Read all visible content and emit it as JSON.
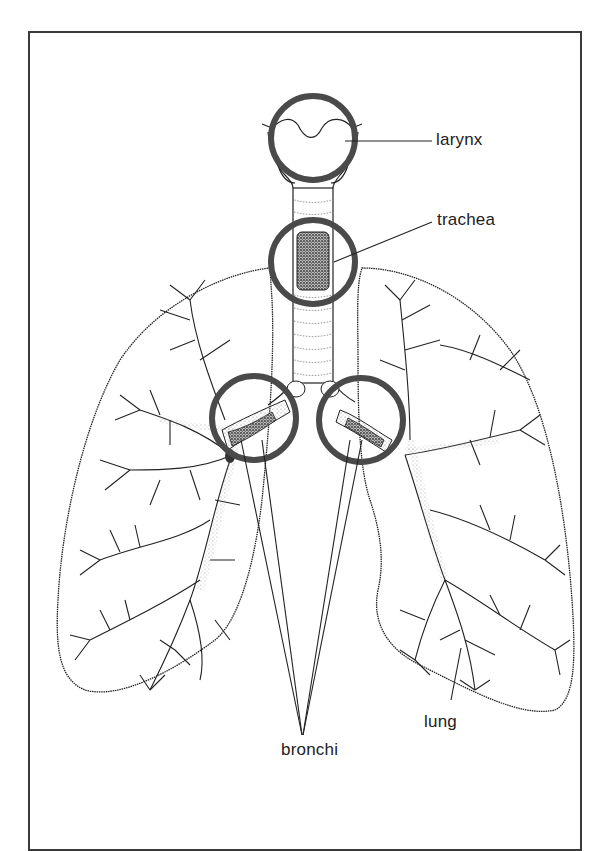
{
  "figure": {
    "labels": {
      "larynx": "larynx",
      "trachea": "trachea",
      "bronchi": "bronchi",
      "lung": "lung"
    },
    "highlight_circles": [
      {
        "target": "larynx",
        "cx": 313,
        "cy": 138,
        "r": 42
      },
      {
        "target": "trachea",
        "cx": 313,
        "cy": 262,
        "r": 42
      },
      {
        "target": "left-bronchus",
        "cx": 254,
        "cy": 418,
        "r": 42
      },
      {
        "target": "right-bronchus",
        "cx": 361,
        "cy": 420,
        "r": 42
      }
    ],
    "colors": {
      "ink": "#222222",
      "circle": "#4a4a4a",
      "frame": "#3a3a3a",
      "stipple": "#9a9a9a"
    }
  }
}
